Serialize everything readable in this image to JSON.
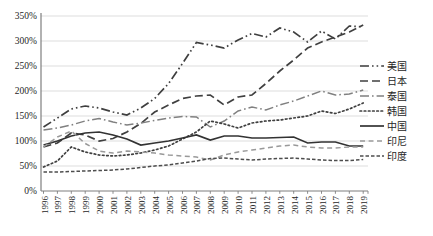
{
  "chart_data": {
    "type": "line",
    "title": "",
    "xlabel": "",
    "ylabel": "",
    "ylim": [
      0,
      350
    ],
    "y_tick_labels": [
      "0%",
      "50%",
      "100%",
      "150%",
      "200%",
      "250%",
      "300%",
      "350%"
    ],
    "grid": true,
    "legend_position": "right",
    "categories": [
      1996,
      1997,
      1998,
      1999,
      2000,
      2001,
      2002,
      2003,
      2004,
      2005,
      2006,
      2007,
      2008,
      2009,
      2010,
      2011,
      2012,
      2013,
      2014,
      2015,
      2016,
      2017,
      2018,
      2019
    ],
    "series": [
      {
        "name": "美国",
        "dash": "dash-dot-dot",
        "color": "#3f3f3f",
        "width": 1.7,
        "values": [
          128,
          146,
          164,
          170,
          166,
          158,
          152,
          166,
          185,
          215,
          255,
          297,
          292,
          286,
          302,
          315,
          308,
          326,
          318,
          298,
          320,
          304,
          330,
          328
        ]
      },
      {
        "name": "日本",
        "dash": "long-dash",
        "color": "#404040",
        "width": 1.7,
        "values": [
          88,
          96,
          116,
          112,
          100,
          105,
          118,
          135,
          158,
          172,
          185,
          190,
          192,
          172,
          188,
          192,
          215,
          240,
          262,
          286,
          298,
          308,
          318,
          332
        ]
      },
      {
        "name": "泰国",
        "dash": "dash-dot",
        "color": "#808080",
        "width": 1.5,
        "values": [
          122,
          126,
          132,
          140,
          145,
          138,
          132,
          136,
          141,
          146,
          149,
          148,
          128,
          140,
          160,
          168,
          162,
          172,
          180,
          190,
          200,
          192,
          194,
          202
        ]
      },
      {
        "name": "韩国",
        "dash": "dot",
        "color": "#404040",
        "width": 1.7,
        "values": [
          48,
          60,
          88,
          78,
          72,
          70,
          72,
          76,
          82,
          90,
          104,
          118,
          140,
          134,
          126,
          136,
          140,
          142,
          146,
          150,
          160,
          155,
          164,
          176
        ]
      },
      {
        "name": "中国",
        "dash": "solid",
        "color": "#333333",
        "width": 1.7,
        "values": [
          92,
          100,
          110,
          116,
          118,
          112,
          104,
          92,
          96,
          100,
          106,
          112,
          102,
          110,
          110,
          106,
          106,
          107,
          108,
          96,
          98,
          98,
          90,
          90
        ]
      },
      {
        "name": "印尼",
        "dash": "dash",
        "color": "#999999",
        "width": 1.5,
        "values": [
          88,
          108,
          120,
          95,
          80,
          76,
          80,
          78,
          76,
          72,
          70,
          68,
          62,
          72,
          78,
          82,
          86,
          90,
          92,
          88,
          86,
          86,
          88,
          88
        ]
      },
      {
        "name": "印度",
        "dash": "dense-dash",
        "color": "#4d4d4d",
        "width": 1.5,
        "values": [
          38,
          38,
          39,
          40,
          41,
          42,
          44,
          47,
          50,
          52,
          56,
          60,
          65,
          66,
          64,
          62,
          64,
          65,
          66,
          64,
          62,
          61,
          61,
          63
        ]
      }
    ],
    "colors": {
      "grid": "#d4d4d4",
      "axis": "#7f7f7f",
      "text": "#262626",
      "background": "#ffffff"
    }
  }
}
